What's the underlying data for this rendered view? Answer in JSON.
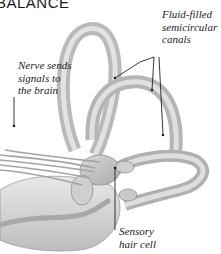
{
  "title": "BALANCE",
  "labels": {
    "canals": [
      "Fluid-filled",
      "semicircular",
      "canals"
    ],
    "nerve": [
      "Nerve sends",
      "signals to",
      "the brain"
    ],
    "hair_cell": [
      "Sensory",
      "hair cell"
    ]
  },
  "colors": {
    "tissue_light": "#e6e6e6",
    "tissue_mid": "#c4c4c4",
    "tissue_dark": "#8e8e8e",
    "leader_line": "#222222"
  }
}
